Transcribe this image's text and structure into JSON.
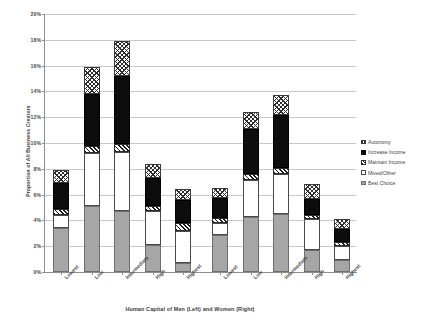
{
  "chart_data": {
    "type": "bar",
    "subtype": "stacked",
    "title": "",
    "xlabel": "Human Capital of Men (Left) and Women (Right)",
    "ylabel": "Proportion of All Business Creators",
    "ylim": [
      0,
      20
    ],
    "ytick_labels": [
      "0%",
      "2%",
      "4%",
      "6%",
      "8%",
      "10%",
      "12%",
      "14%",
      "16%",
      "18%",
      "20%"
    ],
    "ytick_values": [
      0,
      2,
      4,
      6,
      8,
      10,
      12,
      14,
      16,
      18,
      20
    ],
    "grid": true,
    "legend_position": "right",
    "groups": [
      {
        "name": "Men",
        "categories": [
          "Lowest",
          "Low",
          "Intermediate",
          "High",
          "Highest"
        ]
      },
      {
        "name": "Women",
        "categories": [
          "Lowest",
          "Low",
          "Intermediate",
          "High",
          "Highest"
        ]
      }
    ],
    "categories": [
      "Lowest",
      "Low",
      "Intermediate",
      "High",
      "Highest",
      "Lowest",
      "Low",
      "Intermediate",
      "High",
      "Highest"
    ],
    "series": [
      {
        "name": "Best Choice",
        "key": "best",
        "values": [
          3.4,
          5.1,
          4.7,
          2.1,
          0.7,
          2.9,
          4.3,
          4.5,
          1.7,
          0.9
        ]
      },
      {
        "name": "Mixed/Other",
        "key": "mixed",
        "values": [
          1.0,
          4.1,
          4.6,
          2.6,
          2.5,
          0.9,
          2.8,
          3.1,
          2.4,
          1.1
        ]
      },
      {
        "name": "Maintain Income",
        "key": "maintain",
        "values": [
          0.5,
          0.6,
          0.6,
          0.4,
          0.6,
          0.4,
          0.5,
          0.5,
          0.3,
          0.3
        ]
      },
      {
        "name": "Increase Income",
        "key": "increase",
        "values": [
          2.0,
          4.0,
          5.3,
          2.2,
          1.8,
          1.5,
          3.5,
          4.1,
          1.3,
          1.0
        ]
      },
      {
        "name": "Autonomy",
        "key": "autonomy",
        "values": [
          1.0,
          2.1,
          2.7,
          1.1,
          0.8,
          0.8,
          1.3,
          1.5,
          1.1,
          0.8
        ]
      }
    ],
    "totals": [
      7.9,
      15.9,
      17.9,
      8.4,
      6.4,
      6.5,
      12.4,
      13.7,
      6.8,
      4.1
    ]
  },
  "legend": {
    "items": [
      {
        "label": "Autonomy",
        "key": "autonomy"
      },
      {
        "label": "Increase Income",
        "key": "increase"
      },
      {
        "label": "Maintain Income",
        "key": "maintain"
      },
      {
        "label": "Mixed/Other",
        "key": "mixed"
      },
      {
        "label": "Best Choice",
        "key": "best"
      }
    ]
  },
  "colors": {
    "best": "#a6a6a6",
    "mixed": "#ffffff",
    "maintain": "#1a1a1a",
    "increase": "#0d0d0d",
    "autonomy": "#2e2e2e",
    "grid": "#c9c9c9",
    "axis": "#8d8d8d",
    "text": "#3f3f3f",
    "background": "#ffffff"
  }
}
